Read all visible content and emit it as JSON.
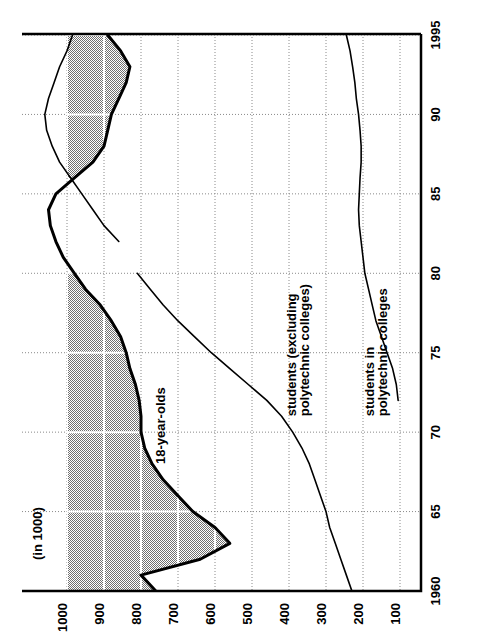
{
  "chart_data": {
    "type": "line",
    "title": "",
    "orientation": "rotated-90-ccw",
    "unit_label": "(in 1000)",
    "xlabel": "",
    "ylabel": "",
    "x": [
      1960,
      1961,
      1962,
      1963,
      1964,
      1965,
      1966,
      1967,
      1968,
      1969,
      1970,
      1971,
      1972,
      1973,
      1974,
      1975,
      1976,
      1977,
      1978,
      1979,
      1980,
      1981,
      1982,
      1983,
      1984,
      1985,
      1986,
      1987,
      1988,
      1989,
      1990,
      1991,
      1992,
      1993,
      1994,
      1995
    ],
    "x_ticks": [
      1960,
      1965,
      1970,
      1975,
      1980,
      1985,
      1990,
      1995
    ],
    "x_tick_labels": [
      "1960",
      "65",
      "70",
      "75",
      "80",
      "85",
      "90",
      "1995"
    ],
    "xlim": [
      1960,
      1996
    ],
    "y_ticks": [
      100,
      200,
      300,
      400,
      500,
      600,
      700,
      800,
      900,
      1000
    ],
    "y_tick_labels": [
      "100",
      "200",
      "300",
      "400",
      "500",
      "600",
      "700",
      "800",
      "900",
      "1000"
    ],
    "ylim": [
      0,
      1080
    ],
    "grid": true,
    "legend_position": "inline-annotations",
    "shaded_band": {
      "fill_hex": "#9c9c9c",
      "from_value": 1000,
      "description": "grey band between the 18-year-olds curve and the 1000 level"
    },
    "series": [
      {
        "name": "18-year-olds",
        "label": "18-year-olds",
        "color_hex": "#000000",
        "line_width": 3,
        "values": [
          760,
          800,
          640,
          560,
          600,
          660,
          700,
          740,
          770,
          790,
          800,
          800,
          805,
          815,
          830,
          840,
          855,
          880,
          910,
          950,
          980,
          1010,
          1030,
          1045,
          1050,
          1030,
          980,
          930,
          900,
          890,
          880,
          860,
          840,
          830,
          855,
          890
        ]
      },
      {
        "name": "students (excluding polytechnic colleges)",
        "label": "students (excluding\npolytechnic colleges)",
        "label_line1": "students (excluding",
        "label_line2": "polytechnic colleges)",
        "color_hex": "#000000",
        "line_width": 1.6,
        "segments": [
          {
            "x": [
              1960,
              1961,
              1962,
              1963,
              1964,
              1965,
              1966,
              1967,
              1968,
              1969,
              1970,
              1971,
              1972,
              1973,
              1974,
              1975,
              1976,
              1977,
              1978,
              1979,
              1980
            ],
            "values": [
              230,
              245,
              260,
              275,
              290,
              300,
              315,
              330,
              345,
              365,
              390,
              420,
              460,
              510,
              560,
              610,
              655,
              700,
              740,
              775,
              810
            ]
          },
          {
            "x": [
              1982,
              1983,
              1984,
              1985,
              1986,
              1987,
              1988,
              1989,
              1990,
              1991,
              1992,
              1993,
              1994,
              1995
            ],
            "values": [
              860,
              900,
              930,
              960,
              990,
              1020,
              1040,
              1055,
              1060,
              1050,
              1035,
              1020,
              1000,
              985
            ]
          }
        ]
      },
      {
        "name": "students in polytechnic colleges",
        "label": "students in\npolytechnic colleges",
        "label_line1": "students in",
        "label_line2": "polytechnic colleges",
        "color_hex": "#000000",
        "line_width": 1.6,
        "x": [
          1972,
          1973,
          1974,
          1975,
          1976,
          1977,
          1978,
          1979,
          1980,
          1981,
          1982,
          1983,
          1984,
          1985,
          1986,
          1987,
          1988,
          1989,
          1990,
          1991,
          1992,
          1993,
          1994,
          1995
        ],
        "values": [
          105,
          110,
          120,
          135,
          150,
          165,
          175,
          185,
          195,
          200,
          205,
          210,
          212,
          210,
          208,
          205,
          205,
          208,
          212,
          218,
          222,
          228,
          235,
          245
        ]
      }
    ],
    "annotations": [
      {
        "text": "18-year-olds",
        "at_x": 1968,
        "at_y": 735
      },
      {
        "text": "students (excluding",
        "at_x": 1971,
        "at_y": 380
      },
      {
        "text": "polytechnic colleges)",
        "at_x": 1971,
        "at_y": 345
      },
      {
        "text": "students in",
        "at_x": 1971,
        "at_y": 170
      },
      {
        "text": "polytechnic colleges",
        "at_x": 1971,
        "at_y": 135
      }
    ]
  },
  "axis": {
    "unit_label": "(in 1000)",
    "value_ticks": [
      "1000",
      "900",
      "800",
      "700",
      "600",
      "500",
      "400",
      "300",
      "200",
      "100"
    ],
    "year_ticks": [
      "1960",
      "65",
      "70",
      "75",
      "80",
      "85",
      "90",
      "1995"
    ]
  },
  "colors": {
    "shade": "#9c9c9c",
    "line": "#000000",
    "grid": "#8a8a8a",
    "grid_on_shade": "#ffffff",
    "background": "#ffffff"
  }
}
